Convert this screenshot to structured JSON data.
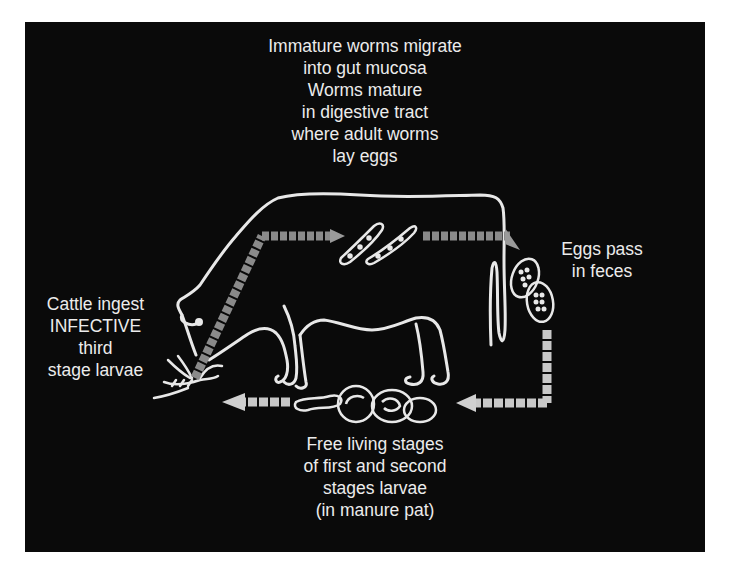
{
  "diagram": {
    "background_color": "#0a0a0a",
    "line_color": "#e8e8e8",
    "arrow_color": "#9a9a9a",
    "stages": {
      "gut": {
        "lines": [
          "Immature worms migrate",
          "into gut mucosa",
          "Worms mature",
          "in digestive tract",
          "where adult worms",
          "lay eggs"
        ]
      },
      "eggs": {
        "lines": [
          "Eggs pass",
          "in feces"
        ]
      },
      "free_living": {
        "lines": [
          "Free living stages",
          "of first and second",
          "stages larvae",
          "(in manure pat)"
        ]
      },
      "ingestion": {
        "lines": [
          "Cattle ingest",
          "INFECTIVE",
          "third",
          "stage larvae"
        ]
      }
    },
    "flow": [
      {
        "from": "ingestion",
        "to": "gut"
      },
      {
        "from": "gut",
        "to": "eggs"
      },
      {
        "from": "eggs",
        "to": "free_living"
      },
      {
        "from": "free_living",
        "to": "ingestion"
      }
    ]
  }
}
